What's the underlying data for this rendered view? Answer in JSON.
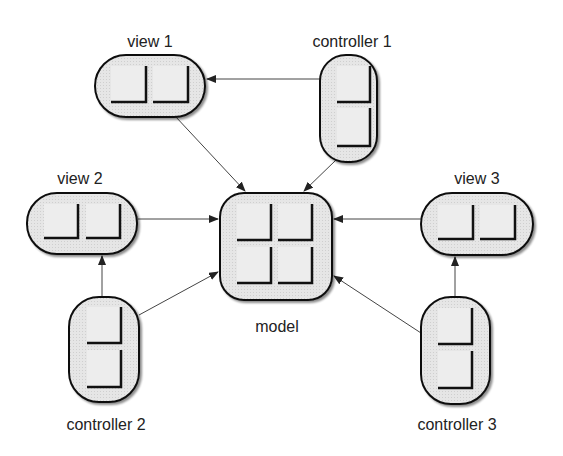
{
  "diagram": {
    "type": "mvc-architecture",
    "colors": {
      "box_fill": "#e4e4e4",
      "box_stroke": "#111111",
      "pane_fill": "#ececec",
      "pane_shadow": "#111111",
      "arrow": "#444444",
      "label": "#222222"
    },
    "nodes": {
      "view1": {
        "label": "view 1",
        "panes": 2,
        "orientation": "horizontal"
      },
      "controller1": {
        "label": "controller 1",
        "panes": 2,
        "orientation": "vertical"
      },
      "view2": {
        "label": "view 2",
        "panes": 2,
        "orientation": "horizontal"
      },
      "model": {
        "label": "model",
        "panes": 4,
        "orientation": "grid"
      },
      "view3": {
        "label": "view 3",
        "panes": 2,
        "orientation": "horizontal"
      },
      "controller2": {
        "label": "controller 2",
        "panes": 2,
        "orientation": "vertical"
      },
      "controller3": {
        "label": "controller 3",
        "panes": 2,
        "orientation": "vertical"
      }
    },
    "edges": [
      {
        "from": "controller1",
        "to": "view1"
      },
      {
        "from": "view1",
        "to": "model"
      },
      {
        "from": "controller1",
        "to": "model"
      },
      {
        "from": "view2",
        "to": "model"
      },
      {
        "from": "view3",
        "to": "model"
      },
      {
        "from": "controller2",
        "to": "view2"
      },
      {
        "from": "controller2",
        "to": "model"
      },
      {
        "from": "controller3",
        "to": "view3"
      },
      {
        "from": "controller3",
        "to": "model"
      }
    ]
  }
}
